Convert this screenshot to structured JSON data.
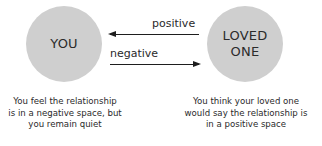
{
  "nodes": {
    "you": {
      "label": "YOU",
      "color": "#cfcfcf"
    },
    "loved_one": {
      "label_line1": "LOVED",
      "label_line2": "ONE",
      "color": "#cfcfcf"
    }
  },
  "edges": {
    "positive": {
      "label": "positive",
      "direction": "loved_one -> you"
    },
    "negative": {
      "label": "negative",
      "direction": "you -> loved_one"
    }
  },
  "captions": {
    "you": [
      "You feel the relationship",
      "is in a negative space, but",
      "you remain quiet"
    ],
    "loved_one": [
      "You think your loved one",
      "would say the relationship is",
      "in a positive space"
    ]
  }
}
